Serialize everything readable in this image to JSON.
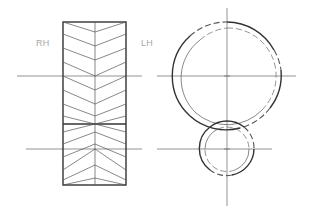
{
  "figure": {
    "labels": {
      "right_hand": "RH",
      "left_hand": "LH"
    },
    "side_view": {
      "description": "herringbone (double-helical) gear face view",
      "rect": {
        "x": 63,
        "y": 22,
        "width": 63,
        "height": 163
      },
      "divider_y": 124
    },
    "end_view": {
      "large_gear": {
        "cx": 227,
        "cy": 76,
        "r_outer": 54,
        "r_inner": 48
      },
      "small_gear": {
        "cx": 227,
        "cy": 149,
        "r_outer": 27,
        "r_inner": 22
      }
    },
    "colors": {
      "line": "#333333",
      "label": "#a8a8a8"
    }
  }
}
